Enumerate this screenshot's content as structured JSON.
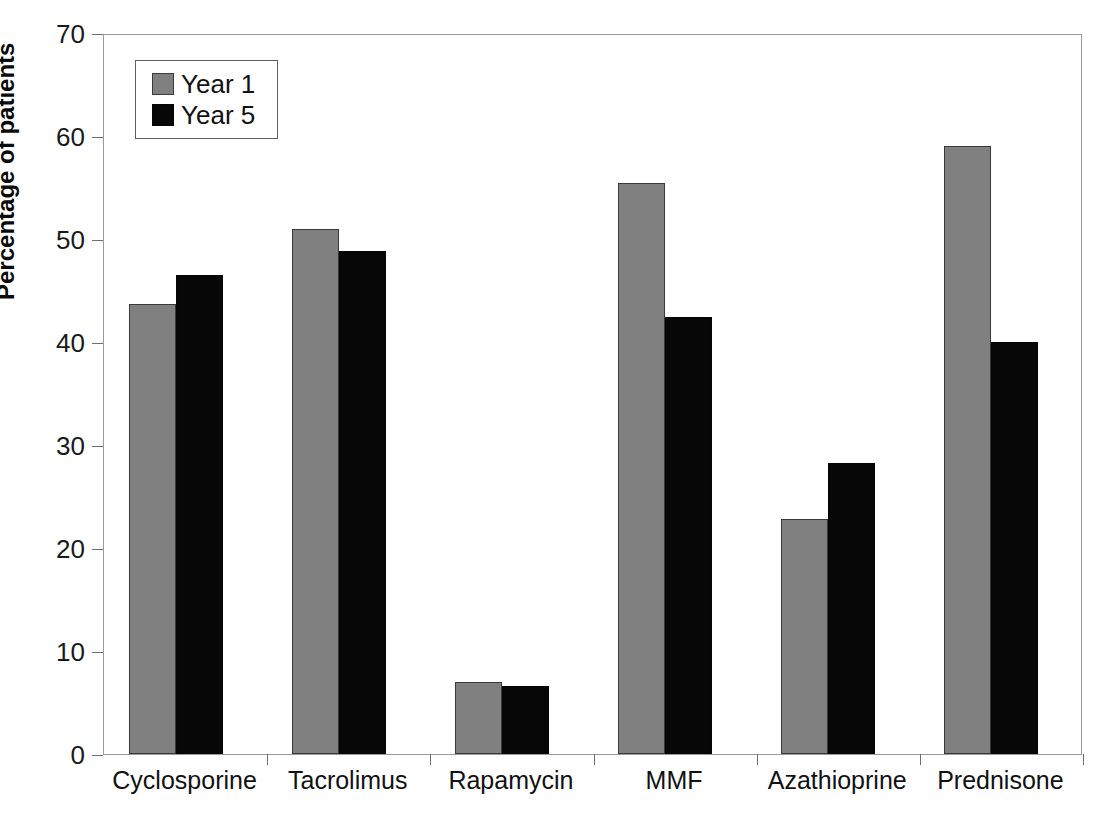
{
  "chart_data": {
    "type": "bar",
    "title": "",
    "xlabel": "",
    "ylabel": "Percentage of patients",
    "ylim": [
      0,
      70
    ],
    "yticks": [
      0,
      10,
      20,
      30,
      40,
      50,
      60,
      70
    ],
    "grid": false,
    "legend_position": "top-left-inside",
    "categories": [
      "Cyclosporine",
      "Tacrolimus",
      "Rapamycin",
      "MMF",
      "Azathioprine",
      "Prednisone"
    ],
    "series": [
      {
        "name": "Year 1",
        "color": "#808080",
        "values": [
          43.7,
          51.0,
          7.0,
          55.4,
          22.8,
          59.0
        ]
      },
      {
        "name": "Year 5",
        "color": "#070707",
        "values": [
          46.5,
          48.8,
          6.6,
          42.4,
          28.3,
          40.0
        ]
      }
    ]
  },
  "legend": {
    "items": [
      {
        "label": "Year 1",
        "swatch": "gray-swatch"
      },
      {
        "label": "Year 5",
        "swatch": "black-swatch"
      }
    ]
  },
  "caption": "",
  "axis": {
    "y_title": "Percentage of patients"
  }
}
